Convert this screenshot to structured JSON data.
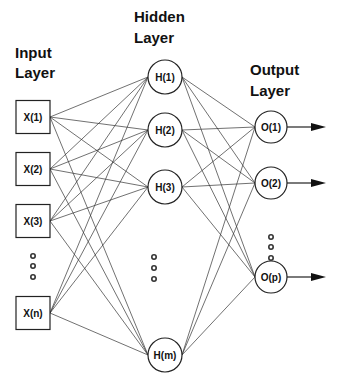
{
  "diagram": {
    "colors": {
      "stroke": "#222222",
      "text": "#111111",
      "background": "#ffffff"
    },
    "layers": {
      "input": {
        "label_line1": "Input",
        "label_line2": "Layer",
        "label_pos": {
          "x": 15,
          "y1": 58,
          "y2": 78
        },
        "shape": "square",
        "x": 16,
        "w": 34,
        "h": 33,
        "nodes": [
          {
            "id": "x1",
            "label": "X(1)",
            "cy": 117
          },
          {
            "id": "x2",
            "label": "X(2)",
            "cy": 169
          },
          {
            "id": "x3",
            "label": "X(3)",
            "cy": 221
          },
          {
            "id": "xn",
            "label": "X(n)",
            "cy": 313
          }
        ],
        "ellipsis_dots": {
          "x": 33,
          "ys": [
            256,
            266,
            277
          ]
        }
      },
      "hidden": {
        "label_line1": "Hidden",
        "label_line2": "Layer",
        "label_pos": {
          "x": 134,
          "y1": 22,
          "y2": 43
        },
        "shape": "circle",
        "cx": 165,
        "r": 17,
        "nodes": [
          {
            "id": "h1",
            "label": "H(1)",
            "cy": 77
          },
          {
            "id": "h2",
            "label": "H(2)",
            "cy": 130
          },
          {
            "id": "h3",
            "label": "H(3)",
            "cy": 187
          },
          {
            "id": "hm",
            "label": "H(m)",
            "cy": 355
          }
        ],
        "ellipsis_dots": {
          "x": 154,
          "ys": [
            257,
            268,
            279
          ]
        }
      },
      "output": {
        "label_line1": "Output",
        "label_line2": "Layer",
        "label_pos": {
          "x": 250,
          "y1": 75,
          "y2": 96
        },
        "shape": "circle",
        "cx": 271,
        "r": 16,
        "nodes": [
          {
            "id": "o1",
            "label": "O(1)",
            "cy": 127
          },
          {
            "id": "o2",
            "label": "O(2)",
            "cy": 183
          },
          {
            "id": "op",
            "label": "O(p)",
            "cy": 277
          }
        ],
        "ellipsis_dots": {
          "x": 271,
          "ys": [
            237,
            247,
            258
          ]
        },
        "arrow": {
          "x_end": 326
        }
      }
    },
    "connectivity": "fully-connected"
  }
}
